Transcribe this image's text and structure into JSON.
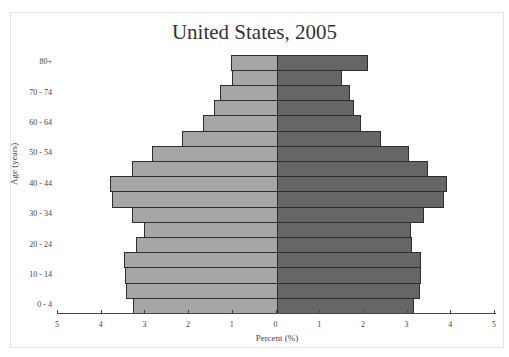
{
  "chart_data": {
    "type": "bar",
    "subtype": "population-pyramid",
    "title": "United States, 2005",
    "xlabel": "Percent (%)",
    "ylabel": "Age (years)",
    "xlim": [
      -5,
      5
    ],
    "x_ticks": [
      5,
      4,
      3,
      2,
      1,
      0,
      1,
      2,
      3,
      4,
      5
    ],
    "categories": [
      "0 - 4",
      "5 - 9",
      "10 - 14",
      "15 - 19",
      "20 - 24",
      "25 - 29",
      "30 - 34",
      "35 - 39",
      "40 - 44",
      "45 - 49",
      "50 - 54",
      "55 - 59",
      "60 - 64",
      "65 - 69",
      "70 - 74",
      "75 - 79",
      "80+"
    ],
    "labeled_categories": [
      "0 - 4",
      "10 - 14",
      "20 - 24",
      "30 - 34",
      "40 - 44",
      "50 - 54",
      "60 - 64",
      "70 - 74",
      "80+"
    ],
    "series": [
      {
        "name": "Left (light)",
        "side": "left",
        "color": "#a6a6a6",
        "values": [
          3.29,
          3.45,
          3.47,
          3.5,
          3.23,
          3.04,
          3.32,
          3.78,
          3.82,
          3.32,
          2.86,
          2.17,
          1.69,
          1.44,
          1.3,
          1.03,
          1.05
        ]
      },
      {
        "name": "Right (dark)",
        "side": "right",
        "color": "#666666",
        "values": [
          3.13,
          3.28,
          3.3,
          3.29,
          3.09,
          3.07,
          3.36,
          3.82,
          3.89,
          3.46,
          3.02,
          2.38,
          1.92,
          1.76,
          1.67,
          1.49,
          2.08
        ]
      }
    ],
    "grid": false,
    "legend": "none"
  }
}
